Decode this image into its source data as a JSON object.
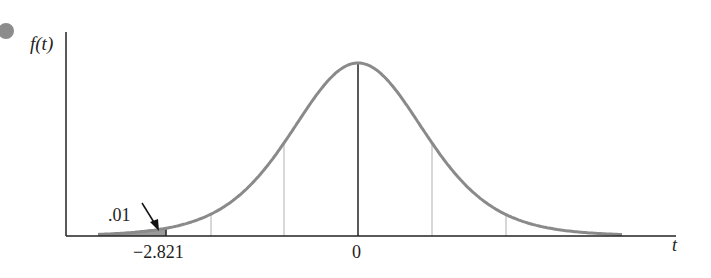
{
  "chart_data": {
    "type": "area",
    "title": "",
    "xlabel": "t",
    "ylabel": "f(t)",
    "distribution": "Student t density curve",
    "x_ticks": [
      "-2.821",
      "0"
    ],
    "critical_value": -2.821,
    "shaded_region": {
      "from": "-inf",
      "to": -2.821,
      "area_label": ".01",
      "tail": "left"
    },
    "annotations": [
      {
        "text": ".01",
        "points_to": "shaded left tail area"
      },
      {
        "text": "-2.821",
        "position": "x-axis, left cutoff"
      },
      {
        "text": "0",
        "position": "x-axis, center"
      }
    ],
    "vertical_guides": [
      "approx -2.0",
      "approx -1.0",
      "0",
      "approx 1.0",
      "approx 2.0"
    ],
    "grid": false,
    "legend": "none",
    "colors": {
      "curve": "#8a8a8a",
      "shade": "#9a9a9a",
      "axis": "#222222",
      "guides": "#b0b0b0",
      "bullet": "#8c8c8c"
    }
  },
  "labels": {
    "y_axis": "f(t)",
    "x_axis": "t",
    "tick_cutoff": "−2.821",
    "tick_zero": "0",
    "tail_area": ".01"
  }
}
